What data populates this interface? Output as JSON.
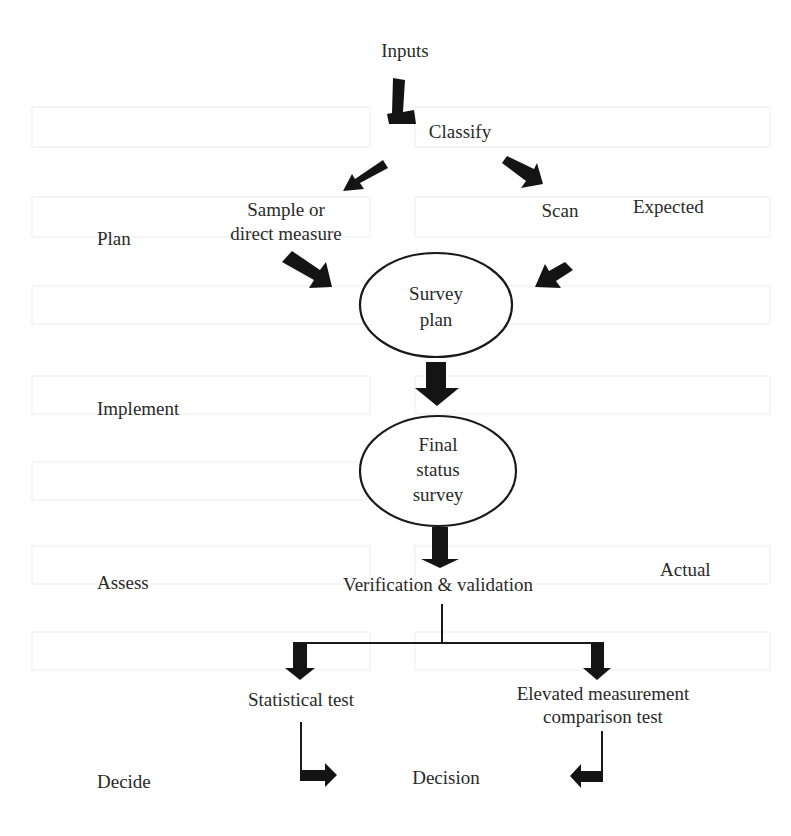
{
  "diagram": {
    "nodes": {
      "inputs": "Inputs",
      "classify": "Classify",
      "sample_line1": "Sample or",
      "sample_line2": "direct measure",
      "scan": "Scan",
      "survey_plan_line1": "Survey",
      "survey_plan_line2": "plan",
      "final_line1": "Final",
      "final_line2": "status",
      "final_line3": "survey",
      "verification": "Verification & validation",
      "statistical_test": "Statistical test",
      "elevated_line1": "Elevated measurement",
      "elevated_line2": "comparison test",
      "decision": "Decision"
    },
    "phases": {
      "plan": "Plan",
      "implement": "Implement",
      "assess": "Assess",
      "decide": "Decide"
    },
    "side_labels": {
      "expected": "Expected",
      "actual": "Actual"
    },
    "colors": {
      "ink": "#141414",
      "background": "#ffffff"
    }
  }
}
